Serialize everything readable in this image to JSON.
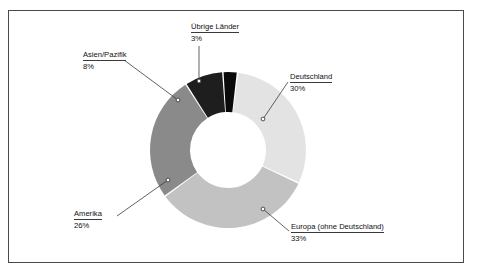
{
  "chart_data": {
    "type": "pie",
    "variant": "donut",
    "title": "",
    "subtitle": "",
    "xlabel": "",
    "ylabel": "",
    "legend_position": "none",
    "grid": false,
    "units": "percent",
    "total": 100,
    "categories": [
      "Deutschland",
      "Europa (ohne Deutschland)",
      "Amerika",
      "Asien/Pazifik",
      "Übrige Länder"
    ],
    "values": [
      30,
      33,
      26,
      8,
      3
    ],
    "slices": [
      {
        "label": "Deutschland",
        "value": 30,
        "value_text": "30%",
        "color": "#e3e3e3"
      },
      {
        "label": "Europa (ohne Deutschland)",
        "value": 33,
        "value_text": "33%",
        "color": "#c2c2c2"
      },
      {
        "label": "Amerika",
        "value": 26,
        "value_text": "26%",
        "color": "#8a8a8a"
      },
      {
        "label": "Asien/Pazifik",
        "value": 8,
        "value_text": "8%",
        "color": "#1e1e1e"
      },
      {
        "label": "Übrige Länder",
        "value": 3,
        "value_text": "3%",
        "color": "#0a0a0a"
      }
    ]
  },
  "labels": {
    "uebrige": {
      "title": "Übrige Länder",
      "value": "3%"
    },
    "asien": {
      "title": "Asien/Pazifik",
      "value": "8%"
    },
    "deutschland": {
      "title": "Deutschland",
      "value": "30%"
    },
    "amerika": {
      "title": "Amerika",
      "value": "26%"
    },
    "europa": {
      "title": "Europa (ohne Deutschland)",
      "value": "33%"
    }
  },
  "colors": {
    "deutschland": "#e3e3e3",
    "europa": "#c2c2c2",
    "amerika": "#8a8a8a",
    "asien": "#1e1e1e",
    "uebrige": "#0a0a0a",
    "frame": "#4a4a4a",
    "leader": "#3a3a3a",
    "background": "#ffffff",
    "text": "#111111"
  }
}
